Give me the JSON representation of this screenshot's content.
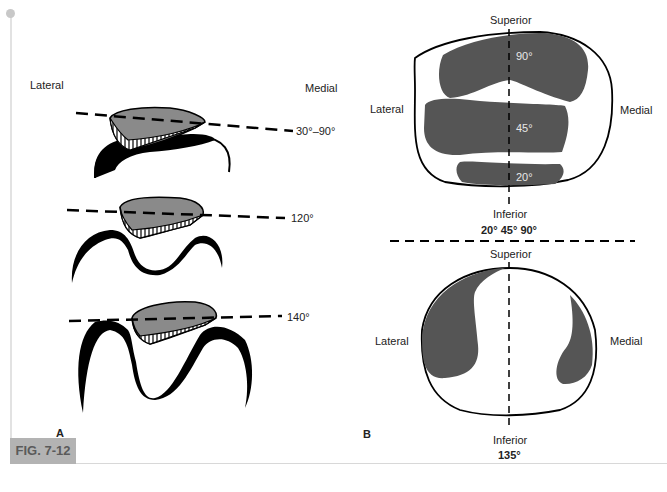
{
  "figure": {
    "caption_label": "FIG. 7-12",
    "colors": {
      "patella_fill": "#8a8a8a",
      "contact_fill": "#555555",
      "ink": "#000000",
      "caption_bg": "#b3b3b3"
    }
  },
  "panel_a": {
    "label": "A",
    "lateral_label": "Lateral",
    "medial_label": "Medial",
    "views": [
      {
        "angle_label": "30°–90°"
      },
      {
        "angle_label": "120°"
      },
      {
        "angle_label": "140°"
      }
    ]
  },
  "panel_b": {
    "label": "B",
    "top_diagram": {
      "superior_label": "Superior",
      "inferior_label": "Inferior",
      "lateral_label": "Lateral",
      "medial_label": "Medial",
      "zones": [
        {
          "label": "90°"
        },
        {
          "label": "45°"
        },
        {
          "label": "20°"
        }
      ],
      "caption": "20° 45° 90°"
    },
    "bottom_diagram": {
      "superior_label": "Superior",
      "inferior_label": "Inferior",
      "lateral_label": "Lateral",
      "medial_label": "Medial",
      "caption": "135°"
    }
  }
}
